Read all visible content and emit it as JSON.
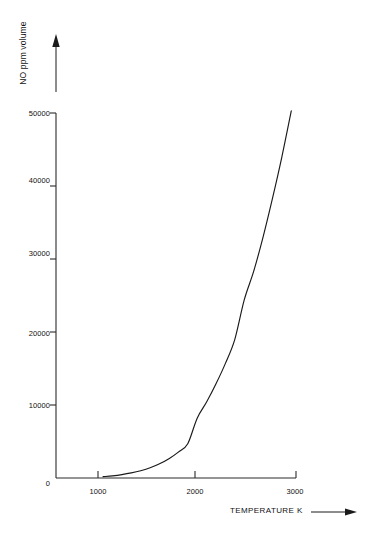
{
  "chart_data": {
    "type": "line",
    "title": "",
    "subtitle": "",
    "xlabel": "TEMPERATURE K",
    "ylabel": "NO ppm volume",
    "xlim": [
      500,
      3050
    ],
    "ylim": [
      0,
      50000
    ],
    "grid": false,
    "legend": null,
    "xticks": [
      1000,
      2000,
      3000
    ],
    "xticklabels": [
      "1000",
      "2000",
      "3000"
    ],
    "yticks": [
      0,
      10000,
      20000,
      30000,
      40000,
      50000
    ],
    "yticklabels": [
      "0",
      "10000",
      "20000",
      "30000",
      "40000",
      "50000"
    ],
    "series": [
      {
        "name": "NO formation",
        "color": "#1a1a1a",
        "x": [
          1000,
          1100,
          1200,
          1300,
          1400,
          1500,
          1600,
          1700,
          1800,
          1900,
          2000,
          2100,
          2200,
          2300,
          2400,
          2500,
          2600,
          2700,
          2800,
          2900,
          3000
        ],
        "values": [
          180,
          300,
          470,
          700,
          1000,
          1400,
          1950,
          2650,
          3550,
          4700,
          8200,
          10400,
          12900,
          15700,
          19000,
          24400,
          28300,
          33000,
          38300,
          44000,
          50300
        ]
      }
    ],
    "axis_arrows": {
      "x": "right-arrow",
      "y": "up-arrow"
    }
  },
  "figure": {
    "background_color": "#ffffff",
    "line_color": "#1a1a1a",
    "axis_color": "#2b2b2b"
  }
}
